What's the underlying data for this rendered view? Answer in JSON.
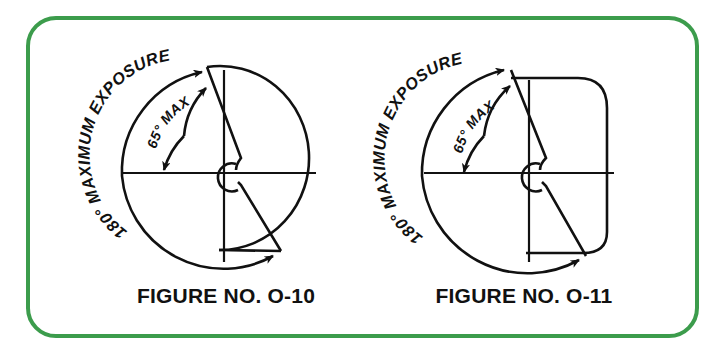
{
  "page": {
    "background_color": "#ffffff",
    "border_color": "#3c9c4c",
    "ink_color": "#111111"
  },
  "figures": [
    {
      "id": "o-10",
      "caption": "FIGURE NO. O-10",
      "body_shape": "circle",
      "outer_arc_label": "180° MAXIMUM EXPOSURE",
      "inner_arc_label": "65° MAX",
      "outer_angle_degrees": 180,
      "inner_angle_degrees": 65,
      "outer_angle_text": "180°",
      "inner_angle_text": "65°",
      "outer_note": "MAXIMUM EXPOSURE",
      "inner_note": "MAX"
    },
    {
      "id": "o-11",
      "caption": "FIGURE NO. O-11",
      "body_shape": "rounded-square",
      "outer_arc_label": "180° MAXIMUM EXPOSURE",
      "inner_arc_label": "65° MAX",
      "outer_angle_degrees": 180,
      "inner_angle_degrees": 65,
      "outer_angle_text": "180°",
      "inner_angle_text": "65°",
      "outer_note": "MAXIMUM EXPOSURE",
      "inner_note": "MAX"
    }
  ]
}
